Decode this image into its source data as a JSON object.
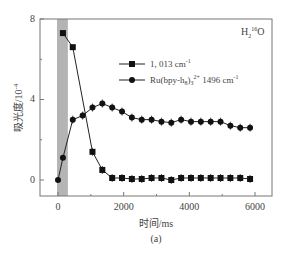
{
  "chart_data": {
    "type": "line",
    "title": "",
    "panel_label": "(a)",
    "annotation": "H2 16O",
    "xlabel": "时间/ms",
    "ylabel": "吸光度/10^-4",
    "xlim": [
      -500,
      6500
    ],
    "ylim": [
      -0.6,
      8
    ],
    "xticks": [
      0,
      2000,
      4000,
      6000
    ],
    "yticks": [
      0,
      4,
      8
    ],
    "shaded_region": {
      "x_start": 0,
      "x_end": 300,
      "color": "#b4b4b4"
    },
    "legend_position": "upper right",
    "series": [
      {
        "name": "1, 013 cm-1",
        "marker": "square",
        "x": [
          150,
          450,
          1050,
          1350,
          1650,
          1950,
          2250,
          2550,
          2850,
          3150,
          3450,
          3750,
          4050,
          4350,
          4650,
          4950,
          5250,
          5550,
          5850
        ],
        "values": [
          7.3,
          6.6,
          1.4,
          0.5,
          0.1,
          0.1,
          0.05,
          0.05,
          0.1,
          0.1,
          0.0,
          0.1,
          0.1,
          0.1,
          0.1,
          0.1,
          0.1,
          0.1,
          0.05
        ]
      },
      {
        "name": "Ru(bpy-h8)3 2+ 1496 cm-1",
        "marker": "circle",
        "x": [
          0,
          150,
          450,
          750,
          1050,
          1350,
          1650,
          1950,
          2250,
          2550,
          2850,
          3150,
          3450,
          3750,
          4050,
          4350,
          4650,
          4950,
          5250,
          5550,
          5850
        ],
        "values": [
          0.0,
          1.1,
          3.0,
          3.2,
          3.6,
          3.8,
          3.6,
          3.4,
          3.1,
          3.0,
          3.0,
          2.9,
          2.85,
          3.0,
          2.9,
          2.9,
          2.9,
          2.9,
          2.7,
          2.6,
          2.6
        ]
      }
    ]
  },
  "text": {
    "ytick_0": "0",
    "ytick_4": "4",
    "ytick_8": "8",
    "xtick_0": "0",
    "xtick_2000": "2000",
    "xtick_4000": "4000",
    "xtick_6000": "6000",
    "xlabel": "时间/ms",
    "ylabel_main": "吸光度/10",
    "ylabel_sup": "-4",
    "panel": "(a)",
    "annot_h": "H",
    "annot_sub": "2",
    "annot_sup": "16",
    "annot_o": "O",
    "legend1": "1, 013 cm",
    "legend1_sup": "-1",
    "legend2_a": "Ru(bpy-h",
    "legend2_sub8": "8",
    "legend2_b": ")",
    "legend2_sub3": "3",
    "legend2_sup": "2+",
    "legend2_c": " 1496 cm",
    "legend2_sup2": "-1"
  }
}
